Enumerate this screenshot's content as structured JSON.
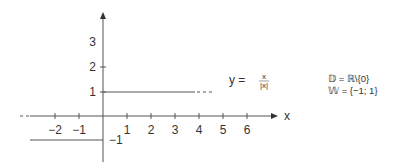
{
  "graph": {
    "function_label": "y = ",
    "fraction_num": "x",
    "fraction_den": "|x|",
    "x_axis_label": "x",
    "x_ticks": [
      "−2",
      "−1",
      "1",
      "2",
      "3",
      "4",
      "5",
      "6"
    ],
    "y_ticks": [
      "3",
      "2",
      "1",
      "−1"
    ]
  },
  "domain_info": {
    "domain": "𝔻 = ℝ\\{0}",
    "range": "𝕎 = {−1; 1}"
  },
  "colors": {
    "ink": "#333333",
    "line": "#555555"
  }
}
